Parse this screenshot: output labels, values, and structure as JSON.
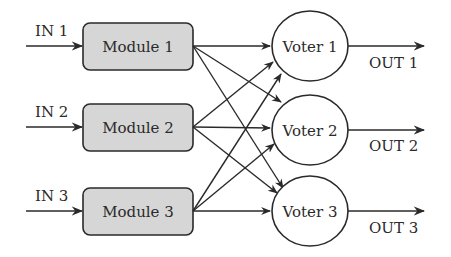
{
  "diagram": {
    "type": "triple modular redundancy with triplicated voters",
    "inputs": [
      {
        "label": "IN 1"
      },
      {
        "label": "IN 2"
      },
      {
        "label": "IN 3"
      }
    ],
    "modules": [
      {
        "label": "Module 1"
      },
      {
        "label": "Module 2"
      },
      {
        "label": "Module 3"
      }
    ],
    "voters": [
      {
        "label": "Voter 1"
      },
      {
        "label": "Voter 2"
      },
      {
        "label": "Voter 3"
      }
    ],
    "outputs": [
      {
        "label": "OUT 1"
      },
      {
        "label": "OUT 2"
      },
      {
        "label": "OUT 3"
      }
    ],
    "connections": "Each module output connects to all three voters",
    "colors": {
      "module_fill": "#d6d6d6",
      "stroke": "#2a2a2a",
      "background": "#ffffff"
    }
  }
}
